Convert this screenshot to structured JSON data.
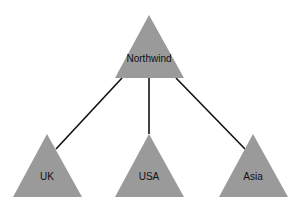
{
  "diagram": {
    "type": "hierarchy",
    "colors": {
      "node_fill": "#9a9a9a",
      "edge_stroke": "#111111",
      "background": "#ffffff"
    },
    "root": {
      "label": "Northwind",
      "shape": "triangle"
    },
    "children": [
      {
        "label": "UK",
        "shape": "triangle"
      },
      {
        "label": "USA",
        "shape": "triangle"
      },
      {
        "label": "Asia",
        "shape": "triangle"
      }
    ],
    "edges": [
      {
        "from": "Northwind",
        "to": "UK"
      },
      {
        "from": "Northwind",
        "to": "USA"
      },
      {
        "from": "Northwind",
        "to": "Asia"
      }
    ]
  }
}
